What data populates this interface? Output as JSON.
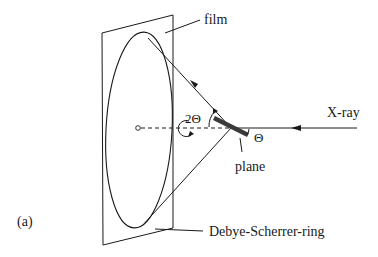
{
  "figure": {
    "panel_label": "(a)",
    "labels": {
      "film": "film",
      "two_theta": "2Θ",
      "theta": "Θ",
      "xray": "X-ray",
      "plane": "plane",
      "ring": "Debye-Scherrer-ring"
    },
    "colors": {
      "stroke": "#1a1a1a",
      "plane_fill": "#555555",
      "background": "#ffffff"
    }
  }
}
